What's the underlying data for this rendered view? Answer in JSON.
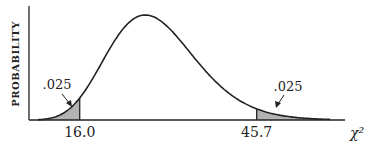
{
  "chart_data": {
    "type": "area",
    "title": "",
    "ylabel": "PROBABILITY",
    "xlabel": "χ²",
    "x_ticks": [
      "16.0",
      "45.7"
    ],
    "critical_values": {
      "lower": 16.0,
      "upper": 45.7
    },
    "tail_areas": {
      "lower": 0.025,
      "upper": 0.025
    },
    "annotations": [
      {
        "text": ".025",
        "target": "lower-tail"
      },
      {
        "text": ".025",
        "target": "upper-tail"
      }
    ],
    "degrees_of_freedom_estimate": 29,
    "xlim": [
      9,
      58
    ],
    "grid": false,
    "shade_color": "#b3b3b3",
    "line_color": "#222222"
  }
}
